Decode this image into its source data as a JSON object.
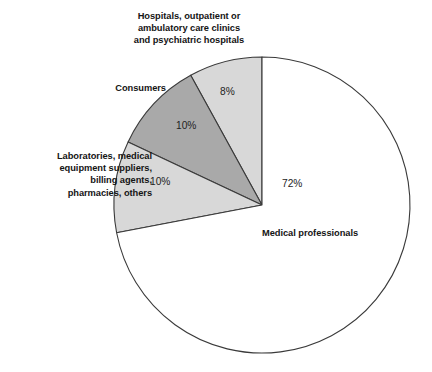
{
  "chart_data": {
    "type": "pie",
    "title": "",
    "subtitle": "",
    "xlabel": "",
    "ylabel": "",
    "legend_position": "callout-labels",
    "grid": false,
    "start_angle_deg": 90,
    "direction": "counterclockwise",
    "center": {
      "x": 262,
      "y": 205
    },
    "radius": 148,
    "categories": [
      "Hospitals, outpatient or ambulatory care clinics and psychiatric hospitals",
      "Consumers",
      "Laboratories, medical equipment suppliers, billing agents, pharmacies, others",
      "Medical professionals"
    ],
    "values": [
      8,
      10,
      10,
      72
    ],
    "slices": [
      {
        "label": "Hospitals, outpatient or\nambulatory care clinics\nand psychiatric hospitals",
        "value": 8,
        "value_label": "8%",
        "color": "#d8d8d8",
        "stroke": "#3a3a3a"
      },
      {
        "label": "Consumers",
        "value": 10,
        "value_label": "10%",
        "color": "#a9a9a9",
        "stroke": "#3a3a3a"
      },
      {
        "label": "Laboratories, medical\nequipment suppliers,\nbilling agents,\npharmacies, others",
        "value": 10,
        "value_label": "10%",
        "color": "#d8d8d8",
        "stroke": "#3a3a3a"
      },
      {
        "label": "Medical professionals",
        "value": 72,
        "value_label": "72%",
        "color": "#ffffff",
        "stroke": "#3a3a3a"
      }
    ]
  },
  "labels": {
    "hospitals": "Hospitals, outpatient or\nambulatory care clinics\nand psychiatric hospitals",
    "consumers": "Consumers",
    "laboratories": "Laboratories, medical\nequipment suppliers,\nbilling agents,\npharmacies, others",
    "medical_professionals": "Medical professionals"
  },
  "values": {
    "hospitals": "8%",
    "consumers": "10%",
    "laboratories": "10%",
    "medical_professionals": "72%"
  },
  "colors": {
    "light_gray": "#d8d8d8",
    "dark_gray": "#a9a9a9",
    "white": "#ffffff",
    "outline": "#3a3a3a",
    "text": "#141414",
    "background": "#ffffff"
  }
}
